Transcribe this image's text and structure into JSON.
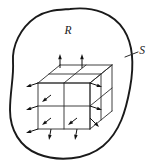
{
  "figure": {
    "background_color": "#ffffff",
    "line_color": "#1a1a1a",
    "width": 159,
    "height": 168
  },
  "labels": {
    "region": {
      "text": "R",
      "x": 68,
      "y": 31
    },
    "surface": {
      "text": "S",
      "x": 142,
      "y": 51
    }
  },
  "leader": {
    "from_x": 125,
    "from_y": 57,
    "to_x": 138,
    "to_y": 52
  },
  "blob": {
    "path": "M 70 9 C 94 6 114 14 124 30 C 134 46 134 66 130 88 C 126 110 120 132 103 146 C 86 160 58 162 38 154 C 20 147 10 130 10 110 C 10 92 14 76 13 62 C 12 46 20 28 36 17 C 47 10 58 10 70 9 Z"
  },
  "grid": {
    "description": "2 by 2 by 2 array of cubes in oblique projection",
    "divisions": 2,
    "front_face_origin_x": 38,
    "front_face_origin_y": 83,
    "cell_width": 26,
    "cell_height": 23,
    "depth_dx": 22,
    "depth_dy": -18
  },
  "arrows": {
    "top": [
      {
        "x": 60,
        "y": 68,
        "dx": 0,
        "dy": -14
      },
      {
        "x": 82,
        "y": 68,
        "dx": 0,
        "dy": -14
      }
    ],
    "left": [
      {
        "x": 38,
        "y": 83,
        "dx": -12,
        "dy": 4
      },
      {
        "x": 38,
        "y": 106,
        "dx": -12,
        "dy": 4
      },
      {
        "x": 38,
        "y": 129,
        "dx": -12,
        "dy": 4
      }
    ],
    "right": [
      {
        "x": 90,
        "y": 83,
        "dx": 12,
        "dy": 4
      },
      {
        "x": 90,
        "y": 106,
        "dx": 12,
        "dy": 4
      }
    ],
    "front": [
      {
        "x": 51,
        "y": 95,
        "dx": -9,
        "dy": 7
      },
      {
        "x": 51,
        "y": 118,
        "dx": -9,
        "dy": 7
      },
      {
        "x": 77,
        "y": 118,
        "dx": -9,
        "dy": 7
      }
    ],
    "bottom": [
      {
        "x": 51,
        "y": 129,
        "dx": -2,
        "dy": 11
      },
      {
        "x": 77,
        "y": 129,
        "dx": -2,
        "dy": 11
      },
      {
        "x": 90,
        "y": 118,
        "dx": 9,
        "dy": 9
      }
    ]
  }
}
